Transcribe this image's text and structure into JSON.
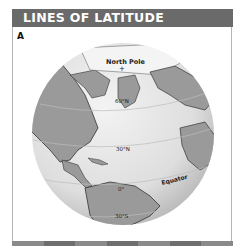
{
  "header": {
    "title": "LINES OF LATITUDE",
    "bg_color": "#6a6a6a"
  },
  "panel": {
    "label": "A"
  },
  "globe": {
    "labels": {
      "north_pole": "North Pole",
      "lat_60": "60°N",
      "lat_30": "30°N",
      "lat_0": "0°",
      "equator": "Equator",
      "lat_30s": "30°S"
    },
    "colors": {
      "ocean": "#e6e6e6",
      "land": "#9a9a9a",
      "ice": "#f4f4f4",
      "coast": "#333333"
    }
  },
  "footer": {
    "segments": [
      "#8a8a8a",
      "#6e6e6e",
      "#8a8a8a",
      "#6e6e6e",
      "#8a8a8a",
      "#6e6e6e",
      "#8a8a8a"
    ]
  }
}
